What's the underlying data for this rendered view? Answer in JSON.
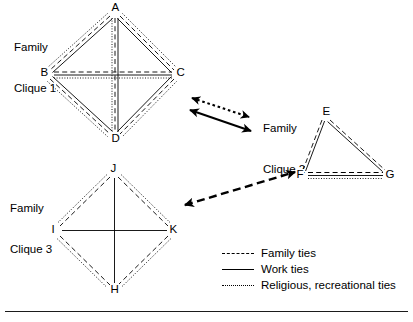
{
  "figure": {
    "title_text": "",
    "width": 413,
    "height": 322,
    "ink_color": "#000000",
    "background_color": "#ffffff"
  },
  "cliques": [
    {
      "id": "clique1",
      "label": "Family\nClique 1",
      "label_line1": "Family",
      "label_line2": "Clique 1",
      "shape": "diamond",
      "nodes": [
        {
          "name": "A",
          "x": 115,
          "y": 10
        },
        {
          "name": "B",
          "x": 47,
          "y": 74
        },
        {
          "name": "C",
          "x": 177,
          "y": 74
        },
        {
          "name": "D",
          "x": 115,
          "y": 139
        }
      ],
      "edges": [
        {
          "from": "A",
          "to": "B",
          "ties": [
            "family",
            "work",
            "religious"
          ]
        },
        {
          "from": "A",
          "to": "C",
          "ties": [
            "family",
            "work",
            "religious"
          ]
        },
        {
          "from": "B",
          "to": "D",
          "ties": [
            "family",
            "work",
            "religious"
          ]
        },
        {
          "from": "C",
          "to": "D",
          "ties": [
            "family",
            "work",
            "religious"
          ]
        },
        {
          "from": "A",
          "to": "D",
          "ties": [
            "family",
            "work",
            "religious"
          ]
        },
        {
          "from": "B",
          "to": "C",
          "ties": [
            "family",
            "work",
            "religious"
          ]
        }
      ]
    },
    {
      "id": "clique2",
      "label": "Family\nClique 2",
      "label_line1": "Family",
      "label_line2": "Clique 2",
      "shape": "triangle",
      "nodes": [
        {
          "name": "E",
          "x": 326,
          "y": 113
        },
        {
          "name": "F",
          "x": 303,
          "y": 176
        },
        {
          "name": "G",
          "x": 388,
          "y": 176
        }
      ],
      "edges": [
        {
          "from": "E",
          "to": "F",
          "ties": [
            "family",
            "work"
          ]
        },
        {
          "from": "E",
          "to": "G",
          "ties": [
            "family",
            "work"
          ]
        },
        {
          "from": "F",
          "to": "G",
          "ties": [
            "family",
            "work",
            "religious"
          ]
        }
      ]
    },
    {
      "id": "clique3",
      "label": "Family\nClique 3",
      "label_line1": "Family",
      "label_line2": "Clique 3",
      "shape": "diamond",
      "nodes": [
        {
          "name": "J",
          "x": 114,
          "y": 170
        },
        {
          "name": "I",
          "x": 57,
          "y": 231
        },
        {
          "name": "K",
          "x": 171,
          "y": 231
        },
        {
          "name": "H",
          "x": 114,
          "y": 290
        }
      ],
      "edges": [
        {
          "from": "J",
          "to": "I",
          "ties": [
            "family",
            "religious"
          ]
        },
        {
          "from": "J",
          "to": "K",
          "ties": [
            "family",
            "religious"
          ]
        },
        {
          "from": "I",
          "to": "H",
          "ties": [
            "family",
            "religious"
          ]
        },
        {
          "from": "K",
          "to": "H",
          "ties": [
            "family",
            "religious"
          ]
        },
        {
          "from": "J",
          "to": "H",
          "ties": [
            "work"
          ]
        },
        {
          "from": "I",
          "to": "K",
          "ties": [
            "work"
          ]
        }
      ]
    }
  ],
  "inter_clique_links": [
    {
      "id": "link-c1-c2-religious",
      "from_clique": "clique1",
      "to_clique": "clique2",
      "tie": "religious",
      "style": "dotted",
      "arrowheads": "both"
    },
    {
      "id": "link-c1-c2-work",
      "from_clique": "clique1",
      "to_clique": "clique2",
      "tie": "work",
      "style": "solid",
      "arrowheads": "both"
    },
    {
      "id": "link-c3-c2-family",
      "from_clique": "clique3",
      "to_clique": "clique2",
      "tie": "family",
      "style": "dashed",
      "arrowheads": "both"
    }
  ],
  "legend": {
    "items": [
      {
        "style": "dashed",
        "label": "Family ties"
      },
      {
        "style": "solid",
        "label": "Work ties"
      },
      {
        "style": "dotted",
        "label": "Religious, recreational ties"
      }
    ]
  }
}
